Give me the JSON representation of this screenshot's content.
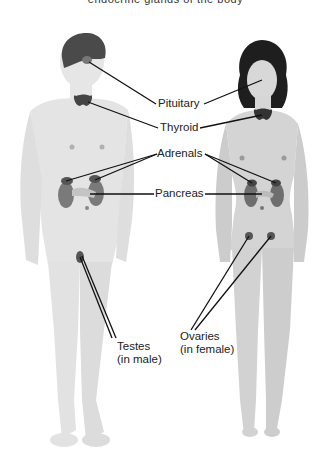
{
  "caption": "endocrine glands of the body",
  "labels": {
    "pituitary": "Pituitary",
    "thyroid": "Thyroid",
    "adrenals": "Adrenals",
    "pancreas": "Pancreas",
    "testes_line1": "Testes",
    "testes_line2": "(in male)",
    "ovaries_line1": "Ovaries",
    "ovaries_line2": "(in female)"
  },
  "colors": {
    "body": "#e4e4e4",
    "body_shade": "#d2d2d2",
    "female_body": "#d6d6d6",
    "hair": "#1e1e1e",
    "brain": "#4a4a4a",
    "gland": "#555555",
    "leader_line": "#111111"
  }
}
